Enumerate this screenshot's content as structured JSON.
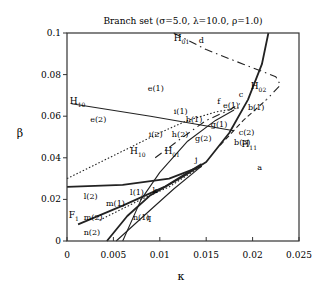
{
  "chart_data": {
    "type": "line",
    "title": "Branch set (σ=5.0, λ=10.0, ρ=1.0)",
    "xlabel": "κ",
    "ylabel": "β",
    "xlim": [
      0,
      0.025
    ],
    "ylim": [
      0,
      0.1
    ],
    "grid": false,
    "legend": "none",
    "x_ticks": [
      "0",
      "0.005",
      "0.01",
      "0.015",
      "0.02",
      "0.025"
    ],
    "y_ticks": [
      "0",
      "0.02",
      "0.04",
      "0.06",
      "0.08",
      "0.1"
    ],
    "series": [
      {
        "name": "main boundary (solid thick)",
        "style": "solid-thick",
        "points": [
          [
            0.0043,
            0
          ],
          [
            0.0065,
            0.012
          ],
          [
            0.009,
            0.022
          ],
          [
            0.0125,
            0.031
          ],
          [
            0.015,
            0.038
          ],
          [
            0.0175,
            0.052
          ],
          [
            0.0195,
            0.068
          ],
          [
            0.021,
            0.085
          ],
          [
            0.0217,
            0.1
          ]
        ]
      },
      {
        "name": "H10",
        "style": "solid",
        "points": [
          [
            0.006,
            0
          ],
          [
            0.008,
            0.02
          ],
          [
            0.01,
            0.033
          ],
          [
            0.013,
            0.048
          ],
          [
            0.016,
            0.058
          ],
          [
            0.018,
            0.063
          ]
        ]
      },
      {
        "name": "H10 horizontal",
        "style": "solid",
        "points": [
          [
            0.0005,
            0.066
          ],
          [
            0.009,
            0.06
          ],
          [
            0.018,
            0.053
          ]
        ]
      },
      {
        "name": "l boundary",
        "style": "solid-thick",
        "points": [
          [
            0,
            0.026
          ],
          [
            0.006,
            0.027
          ],
          [
            0.011,
            0.03
          ],
          [
            0.0145,
            0.036
          ]
        ]
      },
      {
        "name": "F1 line",
        "style": "solid-thick",
        "points": [
          [
            0.0012,
            0.008
          ],
          [
            0.006,
            0.017
          ],
          [
            0.0105,
            0.026
          ],
          [
            0.0145,
            0.037
          ]
        ]
      },
      {
        "name": "q boundary",
        "style": "solid",
        "points": [
          [
            0.0053,
            0
          ],
          [
            0.0085,
            0.013
          ],
          [
            0.0115,
            0.025
          ],
          [
            0.0145,
            0.036
          ]
        ]
      },
      {
        "name": "H01 upper (dash-dot)",
        "style": "dash-dot",
        "points": [
          [
            0.0115,
            0.1
          ],
          [
            0.015,
            0.092
          ],
          [
            0.019,
            0.085
          ],
          [
            0.0225,
            0.079
          ],
          [
            0.023,
            0.075
          ],
          [
            0.0215,
            0.068
          ]
        ]
      },
      {
        "name": "H01 lower (dash-dot)",
        "style": "dash-dot",
        "points": [
          [
            0.0095,
            0.04
          ],
          [
            0.0125,
            0.05
          ],
          [
            0.015,
            0.058
          ],
          [
            0.0175,
            0.063
          ],
          [
            0.019,
            0.067
          ]
        ]
      },
      {
        "name": "H02 (dashed)",
        "style": "dashed",
        "points": [
          [
            0.0165,
            0.046
          ],
          [
            0.019,
            0.058
          ],
          [
            0.0215,
            0.068
          ]
        ]
      },
      {
        "name": "i boundary (dotted)",
        "style": "dotted",
        "points": [
          [
            0,
            0.03
          ],
          [
            0.005,
            0.041
          ],
          [
            0.01,
            0.052
          ],
          [
            0.013,
            0.058
          ],
          [
            0.016,
            0.062
          ],
          [
            0.0185,
            0.064
          ]
        ]
      },
      {
        "name": "k boundary (dotted)",
        "style": "dotted",
        "points": [
          [
            0.0035,
            0.01
          ],
          [
            0.008,
            0.02
          ],
          [
            0.011,
            0.026
          ],
          [
            0.0145,
            0.036
          ]
        ]
      }
    ],
    "annotations": [
      {
        "text": "H",
        "sub": "01",
        "x": 0.0115,
        "y": 0.096
      },
      {
        "text": "d",
        "x": 0.0142,
        "y": 0.095
      },
      {
        "text": "e(1)",
        "x": 0.0087,
        "y": 0.072
      },
      {
        "text": "H",
        "sub": "10",
        "x": 0.0003,
        "y": 0.066
      },
      {
        "text": "e(2)",
        "x": 0.0025,
        "y": 0.057
      },
      {
        "text": "H",
        "sub": "02",
        "x": 0.0198,
        "y": 0.073
      },
      {
        "text": "c",
        "x": 0.0185,
        "y": 0.069
      },
      {
        "text": "f",
        "x": 0.0162,
        "y": 0.066
      },
      {
        "text": "e(1)",
        "x": 0.0168,
        "y": 0.064
      },
      {
        "text": "b(1)",
        "x": 0.0195,
        "y": 0.063
      },
      {
        "text": "i(1)",
        "x": 0.0115,
        "y": 0.061
      },
      {
        "text": "h(1)",
        "x": 0.0128,
        "y": 0.057
      },
      {
        "text": "g(1)",
        "x": 0.0155,
        "y": 0.055
      },
      {
        "text": "i(2)",
        "x": 0.0088,
        "y": 0.05
      },
      {
        "text": "h(2)",
        "x": 0.0113,
        "y": 0.05
      },
      {
        "text": "g(2)",
        "x": 0.0138,
        "y": 0.048
      },
      {
        "text": "c(2)",
        "x": 0.0185,
        "y": 0.051
      },
      {
        "text": "H",
        "sub": "11",
        "x": 0.0188,
        "y": 0.045
      },
      {
        "text": "b(3)",
        "x": 0.018,
        "y": 0.046
      },
      {
        "text": "H",
        "sub": "10",
        "x": 0.0068,
        "y": 0.042
      },
      {
        "text": "H",
        "sub": "01",
        "x": 0.0105,
        "y": 0.042
      },
      {
        "text": "j",
        "x": 0.0138,
        "y": 0.038
      },
      {
        "text": "a",
        "x": 0.0205,
        "y": 0.034
      },
      {
        "text": "l(2)",
        "x": 0.0018,
        "y": 0.02
      },
      {
        "text": "l(1)",
        "x": 0.0068,
        "y": 0.022
      },
      {
        "text": "k",
        "x": 0.0092,
        "y": 0.023
      },
      {
        "text": "m(1)",
        "x": 0.0042,
        "y": 0.017
      },
      {
        "text": "F",
        "sub": "1",
        "x": 0.0002,
        "y": 0.011
      },
      {
        "text": "m(2)",
        "x": 0.0018,
        "y": 0.01
      },
      {
        "text": "n(1)",
        "x": 0.0071,
        "y": 0.01
      },
      {
        "text": "q",
        "x": 0.0085,
        "y": 0.01
      },
      {
        "text": "n(2)",
        "x": 0.0018,
        "y": 0.003
      }
    ]
  },
  "labels": {
    "title": "Branch set (σ=5.0, λ=10.0, ρ=1.0)",
    "xlabel": "κ",
    "ylabel": "β"
  }
}
